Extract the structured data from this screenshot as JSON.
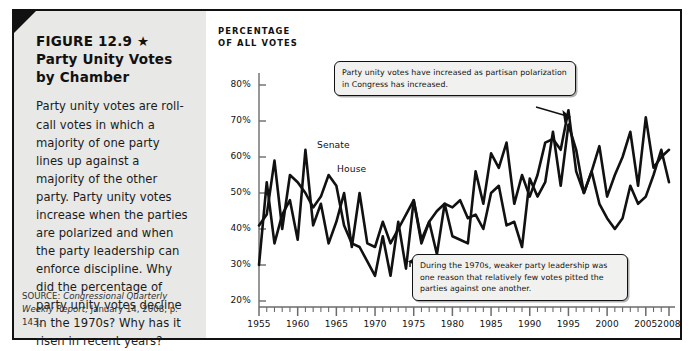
{
  "figure": {
    "number_title": "FIGURE 12.9 ★",
    "title": "Party Unity Votes by Chamber",
    "body": "Party unity votes are roll-call votes in which a majority of one party lines up against a majority of the other party. Party unity votes increase when the parties are polarized and when the party leadership can enforce discipline. Why did the percentage of party unity votes decline in the 1970s? Why has it risen in recent years?",
    "source_prefix": "SOURCE: ",
    "source_italic": "Congressional Quarterly Weekly Report,",
    "source_rest": " January 14, 2008, p. 143."
  },
  "annotations": [
    {
      "id": "top-callout",
      "text": "Party unity votes have increased as partisan polarization in Congress has increased."
    },
    {
      "id": "bottom-callout",
      "text": "During the 1970s, weaker party leadership was one reason that relatively few votes pitted the parties against one another."
    }
  ],
  "chart_data": {
    "type": "line",
    "title": "",
    "ylabel": "PERCENTAGE OF ALL VOTES",
    "xlabel": "",
    "ylim": [
      15,
      85
    ],
    "ytick_values": [
      80,
      70,
      60,
      50,
      40,
      30,
      20
    ],
    "ytick_labels": [
      "80%",
      "70%",
      "60%",
      "50%",
      "40%",
      "30%",
      "20%"
    ],
    "xlim": [
      1954,
      2009
    ],
    "xtick_values": [
      1955,
      1960,
      1965,
      1970,
      1975,
      1980,
      1985,
      1990,
      1995,
      2000,
      2005,
      2008
    ],
    "xtick_labels": [
      "1955",
      "1960",
      "1965",
      "1970",
      "1975",
      "1980",
      "1985",
      "1990",
      "1995",
      "2000",
      "2005",
      "2008"
    ],
    "minor_tick_interval": 1,
    "grid": false,
    "legend_position": "inline",
    "series": [
      {
        "name": "Senate",
        "color": "#111111",
        "x": [
          1955,
          1956,
          1957,
          1958,
          1959,
          1960,
          1961,
          1962,
          1963,
          1964,
          1965,
          1966,
          1967,
          1968,
          1969,
          1970,
          1971,
          1972,
          1973,
          1974,
          1975,
          1976,
          1977,
          1978,
          1979,
          1980,
          1981,
          1982,
          1983,
          1984,
          1985,
          1986,
          1987,
          1988,
          1989,
          1990,
          1991,
          1992,
          1993,
          1994,
          1995,
          1996,
          1997,
          1998,
          1999,
          2000,
          2001,
          2002,
          2003,
          2004,
          2005,
          2006,
          2007,
          2008
        ],
        "values": [
          30,
          53,
          36,
          44,
          48,
          37,
          62,
          41,
          47,
          36,
          42,
          50,
          35,
          50,
          36,
          35,
          42,
          36,
          40,
          44,
          48,
          37,
          42,
          45,
          47,
          46,
          48,
          43,
          44,
          40,
          50,
          52,
          41,
          42,
          35,
          54,
          49,
          53,
          67,
          52,
          69,
          62,
          50,
          56,
          63,
          49,
          55,
          60,
          67,
          52,
          71,
          57,
          60,
          62
        ]
      },
      {
        "name": "House",
        "color": "#111111",
        "x": [
          1955,
          1956,
          1957,
          1958,
          1959,
          1960,
          1961,
          1962,
          1963,
          1964,
          1965,
          1966,
          1967,
          1968,
          1969,
          1970,
          1971,
          1972,
          1973,
          1974,
          1975,
          1976,
          1977,
          1978,
          1979,
          1980,
          1981,
          1982,
          1983,
          1984,
          1985,
          1986,
          1987,
          1988,
          1989,
          1990,
          1991,
          1992,
          1993,
          1994,
          1995,
          1996,
          1997,
          1998,
          1999,
          2000,
          2001,
          2002,
          2003,
          2004,
          2005,
          2006,
          2007,
          2008
        ],
        "values": [
          41,
          44,
          59,
          40,
          55,
          53,
          50,
          46,
          49,
          55,
          52,
          41,
          36,
          35,
          31,
          27,
          38,
          27,
          42,
          29,
          48,
          36,
          42,
          33,
          47,
          38,
          37,
          36,
          56,
          47,
          61,
          57,
          64,
          47,
          55,
          49,
          55,
          64,
          65,
          62,
          73,
          56,
          50,
          56,
          47,
          43,
          40,
          43,
          52,
          47,
          49,
          55,
          62,
          53
        ]
      }
    ]
  }
}
